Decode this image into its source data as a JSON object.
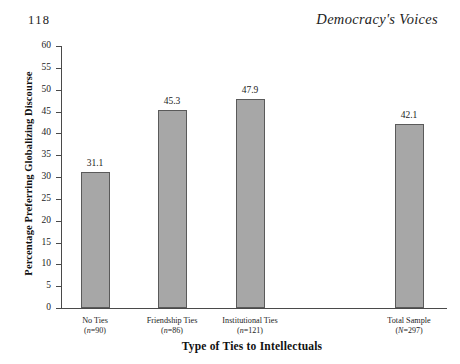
{
  "page": {
    "number": "118",
    "running_head": "Democracy's Voices"
  },
  "chart_data": {
    "type": "bar",
    "title": "",
    "xlabel": "Type of Ties to Intellectuals",
    "ylabel": "Percentage Preferring Globalizing Discourse",
    "ylim": [
      0,
      60
    ],
    "ytick_step": 5,
    "yticks": [
      "60",
      "55",
      "50",
      "45",
      "40",
      "35",
      "30",
      "25",
      "20",
      "15",
      "10",
      "5",
      "0"
    ],
    "grid": false,
    "legend": "none",
    "bar_color": "#a7a7a7",
    "bar_edge_color": "#5a5a5a",
    "categories": [
      "No Ties",
      "Friendship Ties",
      "Institutional Ties",
      "Total Sample"
    ],
    "category_counts": [
      "(n=90)",
      "(n=86)",
      "(n=121)",
      "(N=297)"
    ],
    "values": [
      31.1,
      45.3,
      47.9,
      42.1
    ],
    "value_labels": [
      "31.1",
      "45.3",
      "47.9",
      "42.1"
    ]
  }
}
